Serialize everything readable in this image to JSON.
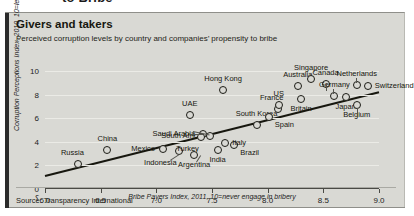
{
  "headline_fragment": "to Bribe",
  "card": {
    "title": "Givers and takers",
    "subtitle": "Perceived corruption levels by country and companies’ propensity to bribe",
    "source": "Source: Transparency International",
    "axis_break_symbol": "⸮"
  },
  "chart_data": {
    "type": "scatter",
    "title": "Givers and takers",
    "subtitle": "Perceived corruption levels by country and companies’ propensity to bribe",
    "xlabel": "Bribe Payers Index, 2011, 10=never engage in bribery",
    "ylabel": "Corruption Perceptions Index, 2010, 10=least corrupt",
    "xlim": [
      6.0,
      9.0
    ],
    "ylim": [
      0,
      10
    ],
    "xticks": [
      "6.0",
      "6.5",
      "7.0",
      "7.5",
      "8.0",
      "8.5",
      "9.0"
    ],
    "xtick_values": [
      6.0,
      6.5,
      7.0,
      7.5,
      8.0,
      8.5,
      9.0
    ],
    "yticks": [
      "0",
      "2",
      "4",
      "6",
      "8",
      "10"
    ],
    "ytick_values": [
      0,
      2,
      4,
      6,
      8,
      10
    ],
    "grid": "horizontal",
    "legend": "none",
    "axis_break": true,
    "trendline": {
      "x": [
        6.0,
        9.0
      ],
      "y": [
        1.1,
        8.2
      ]
    },
    "points": [
      {
        "name": "Russia",
        "x": 6.3,
        "y": 2.1,
        "label_pos": "above-left"
      },
      {
        "name": "China",
        "x": 6.56,
        "y": 3.3,
        "label_pos": "above"
      },
      {
        "name": "Mexico",
        "x": 7.06,
        "y": 3.4,
        "label_pos": "left"
      },
      {
        "name": "Indonesia",
        "x": 7.2,
        "y": 3.2,
        "label_pos": "below-left"
      },
      {
        "name": "Saudi Arabia",
        "x": 7.42,
        "y": 4.7,
        "label_pos": "left"
      },
      {
        "name": "South Africa",
        "x": 7.48,
        "y": 4.5,
        "label_pos": "left"
      },
      {
        "name": "Turkey",
        "x": 7.4,
        "y": 4.4,
        "label_pos": "below-left"
      },
      {
        "name": "India",
        "x": 7.55,
        "y": 3.3,
        "label_pos": "below"
      },
      {
        "name": "Argentina",
        "x": 7.34,
        "y": 2.9,
        "label_pos": "below"
      },
      {
        "name": "Brazil",
        "x": 7.7,
        "y": 3.7,
        "label_pos": "below-right"
      },
      {
        "name": "Italy",
        "x": 7.62,
        "y": 3.9,
        "label_pos": "right"
      },
      {
        "name": "UAE",
        "x": 7.3,
        "y": 6.3,
        "label_pos": "above"
      },
      {
        "name": "Hong Kong",
        "x": 7.6,
        "y": 8.4,
        "label_pos": "above"
      },
      {
        "name": "South Korea",
        "x": 7.9,
        "y": 5.4,
        "label_pos": "above"
      },
      {
        "name": "Spain",
        "x": 8.01,
        "y": 6.1,
        "label_pos": "below-right"
      },
      {
        "name": "France",
        "x": 8.09,
        "y": 6.8,
        "label_pos": "above-left"
      },
      {
        "name": "US",
        "x": 8.1,
        "y": 7.1,
        "label_pos": "above"
      },
      {
        "name": "Australia",
        "x": 8.27,
        "y": 8.7,
        "label_pos": "above"
      },
      {
        "name": "Britain",
        "x": 8.3,
        "y": 7.6,
        "label_pos": "below"
      },
      {
        "name": "Singapore",
        "x": 8.39,
        "y": 9.3,
        "label_pos": "above"
      },
      {
        "name": "Canada",
        "x": 8.52,
        "y": 8.9,
        "label_pos": "above"
      },
      {
        "name": "Germany",
        "x": 8.6,
        "y": 7.9,
        "label_pos": "above"
      },
      {
        "name": "Japan",
        "x": 8.7,
        "y": 7.8,
        "label_pos": "below"
      },
      {
        "name": "Belgium",
        "x": 8.8,
        "y": 7.1,
        "label_pos": "below"
      },
      {
        "name": "Netherlands",
        "x": 8.8,
        "y": 8.8,
        "label_pos": "above"
      },
      {
        "name": "Switzerland",
        "x": 8.9,
        "y": 8.7,
        "label_pos": "right"
      }
    ]
  }
}
